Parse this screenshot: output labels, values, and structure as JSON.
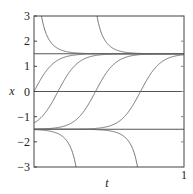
{
  "chart_data": {
    "type": "line",
    "title": "",
    "xlabel": "t",
    "ylabel": "x",
    "xlim": [
      0,
      1
    ],
    "ylim": [
      -3,
      3
    ],
    "x_ticks": [
      "1"
    ],
    "y_ticks": [
      "3",
      "2",
      "1",
      "0",
      "−1",
      "−2",
      "−3"
    ],
    "y_tick_values": [
      3,
      2,
      1,
      0,
      -1,
      -2,
      -3
    ],
    "grid": false,
    "equilibria": [
      1.5,
      0,
      -1.5
    ],
    "model": "x' = 5(2.25 - x^2)",
    "series": [
      {
        "name": "equilibrium x=1.5",
        "kind": "const",
        "value": 1.5
      },
      {
        "name": "equilibrium x=-1.5",
        "kind": "const",
        "value": -1.5
      },
      {
        "name": "x=0 reference",
        "kind": "const",
        "value": 0
      },
      {
        "name": "solution crossing 0 at t=0",
        "kind": "tanh",
        "t0": 0.0
      },
      {
        "name": "solution crossing 0 at t=0.16",
        "kind": "tanh",
        "t0": 0.16
      },
      {
        "name": "solution crossing 0 at t=0.41",
        "kind": "tanh",
        "t0": 0.41
      },
      {
        "name": "solution crossing 0 at t=0.71",
        "kind": "tanh",
        "t0": 0.71
      },
      {
        "name": "solution from x=3 at t=0.05",
        "kind": "coth_upper",
        "t_at_edge": 0.05
      },
      {
        "name": "solution from x=3 at t=0.42",
        "kind": "coth_upper",
        "t_at_edge": 0.42
      },
      {
        "name": "solution to x=-3 at t=0.28",
        "kind": "coth_lower",
        "t_at_edge": 0.28
      },
      {
        "name": "solution to x=-3 at t=0.69",
        "kind": "coth_lower",
        "t_at_edge": 0.69
      }
    ]
  }
}
